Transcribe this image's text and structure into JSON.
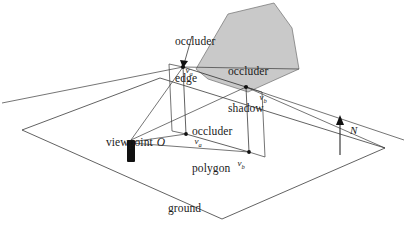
{
  "figure": {
    "type": "3d-geometry-diagram",
    "width": 406,
    "height": 231,
    "background_color": "#ffffff",
    "line_color": "#3a3a3a",
    "shadow_fill_color": "#c9c9c9",
    "shadow_stroke_color": "#6e6e6e",
    "marker_color": "#111111"
  },
  "labels": {
    "occluder_edge": "occluder\nedge",
    "occluder_edge_line1": "occluder",
    "occluder_edge_line2": "edge",
    "occluder_shadow_line1": "occluder",
    "occluder_shadow_line2": "shadow",
    "occluder_polygon_line1": "occluder",
    "occluder_polygon_line2": "polygon",
    "ground_plane_line1": "ground",
    "ground_plane_line2": "plane",
    "viewpoint": "viewpoint",
    "viewpoint_symbol": "O",
    "normal_symbol": "N"
  },
  "vertices": {
    "edge_start": {
      "name": "v",
      "subscript": "a",
      "role": "occluder edge upper endpoint"
    },
    "edge_end": {
      "name": "v",
      "subscript": "b",
      "role": "occluder edge right endpoint"
    },
    "ground_a": {
      "name": "v",
      "subscript": "a",
      "role": "projection of edge start onto ground plane"
    },
    "ground_b": {
      "name": "v",
      "subscript": "b",
      "role": "projection of edge end onto ground plane"
    }
  },
  "geometry": {
    "ground_plane_polygon": "22,130 160,78 385,148 222,219",
    "shadow_polygon": "196,69 228,14 274,3 292,28 299,69 248,92 208,79",
    "occluder_polygon": "183,67 246,87 249,152 186,134",
    "occluder_quad_left": "183,67 186,134",
    "occluder_quad_right": "246,87 249,152",
    "occluder_edge_segment": "183,67 246,87",
    "view_rays": [
      "131,148 183,67",
      "131,148 246,87",
      "131,148 186,134",
      "131,148 249,152"
    ],
    "shadow_boundary_rays": [
      "183,67 299,69",
      "246,87 385,148"
    ],
    "extension_left": "183,67 0,104",
    "extension_right": "246,87 406,140",
    "normal_arrow": {
      "x": 340,
      "y_base": 155,
      "y_tip": 118
    },
    "viewpoint_marker": {
      "x": 127,
      "y": 140,
      "width": 8,
      "height": 22
    }
  }
}
